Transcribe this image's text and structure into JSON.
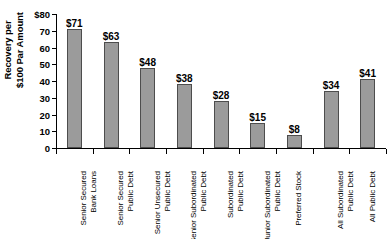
{
  "chart_data": {
    "type": "bar",
    "title": "",
    "subtitle": "",
    "xlabel": "",
    "ylabel_lines": [
      "Recovery per",
      "$100 Par Amount"
    ],
    "ylabel": "Recovery per $100 Par Amount",
    "ylim": [
      0,
      80
    ],
    "ytick_labels": [
      "$80",
      "70",
      "60",
      "50",
      "40",
      "30",
      "20",
      "10",
      "0"
    ],
    "ytick_values": [
      80,
      70,
      60,
      50,
      40,
      30,
      20,
      10,
      0
    ],
    "grid": false,
    "legend": null,
    "categories": [
      "Senior Secured Bank Loans",
      "Senior Secured Public Debt",
      "Senior Unsecured Public Debt",
      "Senior Subordinated Public Debt",
      "Subordinated Public Debt",
      "Junior Subordinated Public Debt",
      "Preferred Stock",
      "All Subordinated Public Debt",
      "All Public Debt"
    ],
    "category_lines": [
      [
        "Senior Secured",
        "Bank Loans"
      ],
      [
        "Senior Secured",
        "Public Debt"
      ],
      [
        "Senior Unsecured",
        "Public Debt"
      ],
      [
        "Senior Subordinated",
        "Public Debt"
      ],
      [
        "Subordinated",
        "Public Debt"
      ],
      [
        "Junior Subordinated",
        "Public Debt"
      ],
      [
        "Preferred Stock"
      ],
      [
        "All Subordinated",
        "Public Debt"
      ],
      [
        "All Public Debt"
      ]
    ],
    "values": [
      71,
      63,
      48,
      38,
      28,
      15,
      8,
      34,
      41
    ],
    "data_labels": [
      "$71",
      "$63",
      "$48",
      "$38",
      "$28",
      "$15",
      "$8",
      "$34",
      "$41"
    ],
    "bar_color": "#9b9b9b",
    "bar_edge_color": "#4d4d4d",
    "axis_color": "#000000",
    "background_color": "#ffffff"
  }
}
